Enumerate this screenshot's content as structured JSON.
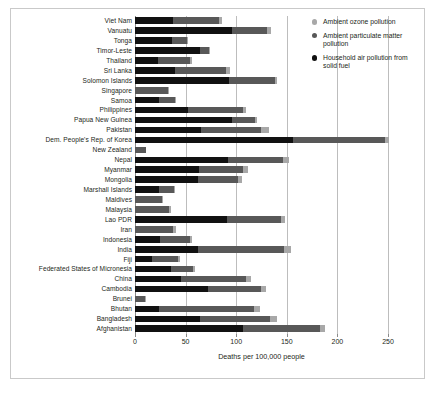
{
  "chart_data": {
    "type": "bar",
    "orientation": "horizontal",
    "stacked": true,
    "title": "",
    "xlabel": "Deaths per 100,000 people",
    "ylabel": "",
    "xlim": [
      0,
      250
    ],
    "xticks": [
      0,
      50,
      100,
      150,
      200,
      250
    ],
    "xtick_labels": [
      "0",
      "50",
      "100",
      "150",
      "200",
      "250"
    ],
    "grid": "vertical",
    "legend_position": "top-right",
    "categories": [
      "Viet Nam",
      "Vanuatu",
      "Tonga",
      "Timor-Leste",
      "Thailand",
      "Sri Lanka",
      "Solomon Islands",
      "Singapore",
      "Samoa",
      "Philippines",
      "Papua New Guinea",
      "Pakistan",
      "Dem. People's Rep. of Korea",
      "New Zealand",
      "Nepal",
      "Myanmar",
      "Mongolia",
      "Marshall Islands",
      "Maldives",
      "Malaysia",
      "Lao PDR",
      "Iran",
      "Indonesia",
      "India",
      "Fiji",
      "Federated States of Micronesia",
      "China",
      "Cambodia",
      "Brunei",
      "Bhutan",
      "Bangladesh",
      "Afghanistan"
    ],
    "series": [
      {
        "name": "Household air pollution from solid fuel",
        "color": "#111111",
        "values": [
          38,
          96,
          37,
          64,
          23,
          40,
          93,
          0,
          24,
          52,
          96,
          65,
          156,
          0,
          92,
          63,
          62,
          24,
          0,
          0,
          91,
          0,
          25,
          62,
          17,
          36,
          45,
          72,
          0,
          24,
          64,
          107
        ]
      },
      {
        "name": "Ambient particulate matter pollution",
        "color": "#585858",
        "values": [
          45,
          34,
          14,
          9,
          31,
          50,
          45,
          33,
          16,
          55,
          23,
          60,
          91,
          11,
          54,
          44,
          40,
          15,
          27,
          34,
          53,
          38,
          29,
          85,
          25,
          21,
          65,
          53,
          10,
          94,
          69,
          76
        ]
      },
      {
        "name": "Ambient ozone pollution",
        "color": "#a8a8a8",
        "values": [
          3,
          4,
          1,
          1,
          2,
          4,
          2,
          1,
          1,
          3,
          2,
          7,
          4,
          0,
          6,
          5,
          4,
          1,
          1,
          2,
          4,
          3,
          2,
          7,
          2,
          2,
          5,
          4,
          1,
          6,
          7,
          5
        ]
      }
    ]
  },
  "legend": {
    "items": [
      {
        "label": "Ambient ozone pollution",
        "color": "#a8a8a8"
      },
      {
        "label": "Ambient particulate matter pollution",
        "color": "#585858"
      },
      {
        "label": "Household air pollution from solid fuel",
        "color": "#111111"
      }
    ]
  }
}
